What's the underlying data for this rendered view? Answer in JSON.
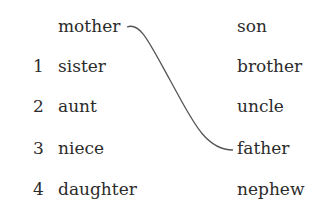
{
  "example": {
    "left": "mother",
    "right": "son"
  },
  "items": [
    {
      "number": "1",
      "left": "sister",
      "right": "brother"
    },
    {
      "number": "2",
      "left": "aunt",
      "right": "uncle"
    },
    {
      "number": "3",
      "left": "niece",
      "right": "father"
    },
    {
      "number": "4",
      "left": "daughter",
      "right": "nephew"
    }
  ],
  "connection": {
    "from": "mother",
    "to": "father",
    "color": "#555555"
  }
}
